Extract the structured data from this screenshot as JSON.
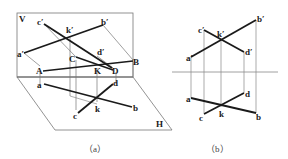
{
  "figure_a": {
    "caption": "（a）",
    "planes": {
      "vertical": "V",
      "horizontal": "H"
    },
    "points_v": {
      "a": "a′",
      "b": "b′",
      "c": "c′",
      "d": "d′",
      "k": "k′"
    },
    "points_space": {
      "A": "A",
      "B": "B",
      "C": "C",
      "D": "D",
      "K": "K"
    },
    "points_h": {
      "a": "a",
      "b": "b",
      "c": "c",
      "d": "d",
      "k": "k"
    }
  },
  "figure_b": {
    "caption": "（b）",
    "points_v": {
      "a": "a′",
      "b": "b′",
      "c": "c′",
      "d": "d′",
      "k": "k′"
    },
    "points_h": {
      "a": "a",
      "b": "b",
      "c": "c",
      "d": "d",
      "k": "k"
    }
  },
  "colors": {
    "line": "#1a1a1a",
    "thin": "#666666"
  }
}
